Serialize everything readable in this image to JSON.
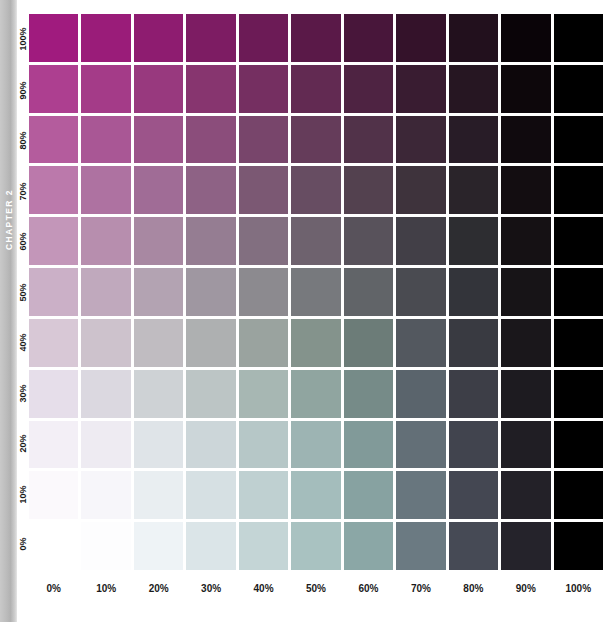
{
  "chapter_rail": {
    "label": "CHAPTER 2"
  },
  "chart_data": {
    "type": "heatmap",
    "title": "",
    "subtitle": "",
    "xlabel": "",
    "ylabel": "",
    "grid": true,
    "legend_position": "none",
    "x_name": "black",
    "y_name": "magenta",
    "x_categories": [
      "0%",
      "10%",
      "20%",
      "30%",
      "40%",
      "50%",
      "60%",
      "70%",
      "80%",
      "90%",
      "100%"
    ],
    "y_categories": [
      "100%",
      "90%",
      "80%",
      "70%",
      "60%",
      "50%",
      "40%",
      "30%",
      "20%",
      "10%",
      "0%"
    ],
    "x_values": [
      0,
      10,
      20,
      30,
      40,
      50,
      60,
      70,
      80,
      90,
      100
    ],
    "y_values": [
      100,
      90,
      80,
      70,
      60,
      50,
      40,
      30,
      20,
      10,
      0
    ],
    "xlim": [
      0,
      100
    ],
    "ylim": [
      0,
      100
    ],
    "cell_colors": [
      [
        "#a01b7e",
        "#9a1c79",
        "#8e1c70",
        "#7d1c63",
        "#6c1b56",
        "#5a1948",
        "#48163a",
        "#34122a",
        "#22101d",
        "#0a0408",
        "#000000"
      ],
      [
        "#ad3f90",
        "#a43b88",
        "#98397e",
        "#87356f",
        "#752f61",
        "#622a52",
        "#4e2342",
        "#391c31",
        "#261622",
        "#0d070b",
        "#000000"
      ],
      [
        "#b45c9d",
        "#a95795",
        "#9c548a",
        "#8b4d7b",
        "#78456b",
        "#653c5a",
        "#513249",
        "#3c2737",
        "#281c27",
        "#100a0e",
        "#000000"
      ],
      [
        "#bb79ab",
        "#ae72a1",
        "#a06c96",
        "#8e6285",
        "#7b5873",
        "#674d62",
        "#53414f",
        "#3e333c",
        "#2a242a",
        "#130d11",
        "#000000"
      ],
      [
        "#c396b9",
        "#b78eae",
        "#a888a2",
        "#957d92",
        "#826f80",
        "#6e626e",
        "#58525b",
        "#423f47",
        "#2d2d31",
        "#151114",
        "#000000"
      ],
      [
        "#cbb0c7",
        "#c0a9bd",
        "#b3a3b2",
        "#9f97a1",
        "#8c8a8f",
        "#77797d",
        "#616468",
        "#4a4b51",
        "#33343a",
        "#171417",
        "#000000"
      ],
      [
        "#d8c8d6",
        "#cdc2cc",
        "#c0bcc1",
        "#aeb0b1",
        "#9aa39f",
        "#84938c",
        "#6c7c78",
        "#53585f",
        "#393a41",
        "#1a171b",
        "#000000"
      ],
      [
        "#e6deea",
        "#dbd8e0",
        "#ced2d5",
        "#bcc5c5",
        "#a7b7b3",
        "#90a5a0",
        "#768b88",
        "#5a646c",
        "#3d3e47",
        "#1d1b20",
        "#000000"
      ],
      [
        "#f3eff6",
        "#eeebf2",
        "#dfe4e8",
        "#ccd6d9",
        "#b6c7c7",
        "#9db4b3",
        "#819a99",
        "#636f77",
        "#41444e",
        "#201e24",
        "#000000"
      ],
      [
        "#fbf9fc",
        "#f7f6fa",
        "#e9eef1",
        "#d6e0e3",
        "#bfd0d1",
        "#a4bdbc",
        "#87a2a1",
        "#68767e",
        "#444752",
        "#232128",
        "#000000"
      ],
      [
        "#ffffff",
        "#fdfdfe",
        "#eef3f6",
        "#dbe5e8",
        "#c4d5d6",
        "#a9c2c1",
        "#8ba7a6",
        "#6b7a82",
        "#464a55",
        "#25232b",
        "#000000"
      ]
    ]
  }
}
